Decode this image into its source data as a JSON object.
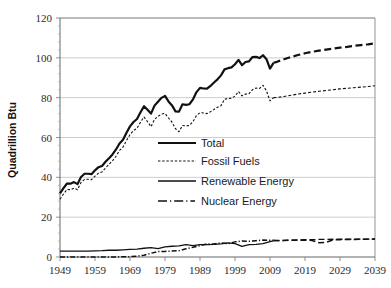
{
  "chart_data": {
    "type": "line",
    "title": "",
    "xlabel": "",
    "ylabel": "Quadrillion Btu",
    "xlim": [
      1949,
      2039
    ],
    "ylim": [
      0,
      120
    ],
    "grid": true,
    "legend_position": "center",
    "x_ticks": [
      1949,
      1959,
      1969,
      1979,
      1989,
      1999,
      2009,
      2019,
      2029,
      2039
    ],
    "y_ticks": [
      0,
      20,
      40,
      60,
      80,
      100,
      120
    ],
    "projection_start_year": 2010,
    "series": [
      {
        "name": "Total",
        "style": "solid-thick",
        "color": "#111111",
        "x": [
          1949,
          1950,
          1951,
          1952,
          1953,
          1954,
          1955,
          1956,
          1957,
          1958,
          1959,
          1960,
          1961,
          1962,
          1963,
          1964,
          1965,
          1966,
          1967,
          1968,
          1969,
          1970,
          1971,
          1972,
          1973,
          1974,
          1975,
          1976,
          1977,
          1978,
          1979,
          1980,
          1981,
          1982,
          1983,
          1984,
          1985,
          1986,
          1987,
          1988,
          1989,
          1990,
          1991,
          1992,
          1993,
          1994,
          1995,
          1996,
          1997,
          1998,
          1999,
          2000,
          2001,
          2002,
          2003,
          2004,
          2005,
          2006,
          2007,
          2008,
          2009,
          2010,
          2011,
          2013,
          2015,
          2017,
          2019,
          2021,
          2023,
          2025,
          2027,
          2029,
          2031,
          2033,
          2035,
          2037,
          2039
        ],
        "values": [
          32.0,
          34.6,
          36.9,
          36.8,
          37.6,
          36.6,
          40.2,
          41.8,
          41.8,
          41.6,
          43.5,
          45.1,
          45.7,
          47.8,
          49.6,
          51.5,
          54.0,
          57.0,
          58.9,
          62.4,
          65.6,
          67.8,
          69.3,
          72.7,
          75.7,
          73.9,
          72.0,
          76.0,
          78.0,
          79.9,
          80.9,
          78.1,
          76.1,
          73.1,
          73.0,
          76.7,
          76.4,
          76.7,
          79.2,
          82.8,
          84.9,
          84.6,
          84.5,
          85.9,
          87.6,
          89.2,
          91.2,
          94.2,
          94.8,
          95.2,
          96.8,
          99.0,
          96.3,
          97.9,
          98.2,
          100.4,
          100.5,
          99.9,
          101.3,
          99.3,
          94.6,
          97.5,
          98.0,
          99.3,
          100.4,
          101.4,
          102.3,
          103.0,
          103.6,
          104.1,
          104.6,
          105.1,
          105.5,
          106.0,
          106.4,
          106.8,
          107.3
        ]
      },
      {
        "name": "Fossil Fuels",
        "style": "dotted",
        "color": "#111111",
        "x": [
          1949,
          1950,
          1951,
          1952,
          1953,
          1954,
          1955,
          1956,
          1957,
          1958,
          1959,
          1960,
          1961,
          1962,
          1963,
          1964,
          1965,
          1966,
          1967,
          1968,
          1969,
          1970,
          1971,
          1972,
          1973,
          1974,
          1975,
          1976,
          1977,
          1978,
          1979,
          1980,
          1981,
          1982,
          1983,
          1984,
          1985,
          1986,
          1987,
          1988,
          1989,
          1990,
          1991,
          1992,
          1993,
          1994,
          1995,
          1996,
          1997,
          1998,
          1999,
          2000,
          2001,
          2002,
          2003,
          2004,
          2005,
          2006,
          2007,
          2008,
          2009,
          2010,
          2011,
          2013,
          2015,
          2017,
          2019,
          2021,
          2023,
          2025,
          2027,
          2029,
          2031,
          2033,
          2035,
          2037,
          2039
        ],
        "values": [
          29.0,
          31.6,
          33.9,
          33.8,
          34.6,
          33.8,
          37.4,
          39.0,
          39.0,
          38.8,
          40.6,
          42.1,
          42.7,
          44.7,
          46.5,
          48.3,
          50.6,
          53.5,
          55.2,
          58.5,
          61.4,
          63.5,
          64.6,
          67.7,
          70.3,
          68.0,
          65.4,
          69.1,
          70.6,
          71.8,
          72.1,
          69.8,
          67.7,
          64.4,
          62.9,
          66.0,
          65.8,
          66.1,
          68.0,
          71.0,
          72.5,
          72.3,
          72.0,
          72.9,
          74.1,
          75.2,
          76.0,
          79.2,
          79.6,
          79.7,
          80.8,
          83.1,
          80.9,
          81.8,
          82.0,
          84.0,
          84.8,
          84.6,
          86.2,
          83.4,
          78.4,
          80.0,
          80.1,
          80.6,
          81.2,
          81.8,
          82.3,
          82.8,
          83.2,
          83.6,
          84.0,
          84.4,
          84.7,
          85.0,
          85.3,
          85.6,
          86.0
        ]
      },
      {
        "name": "Renewable Energy",
        "style": "solid-thin",
        "color": "#111111",
        "x": [
          1949,
          1951,
          1953,
          1955,
          1957,
          1959,
          1961,
          1963,
          1965,
          1967,
          1969,
          1971,
          1973,
          1975,
          1977,
          1979,
          1981,
          1983,
          1985,
          1987,
          1989,
          1991,
          1993,
          1995,
          1997,
          1999,
          2001,
          2003,
          2005,
          2007,
          2009,
          2010,
          2011,
          2013,
          2015,
          2017,
          2019,
          2021,
          2023,
          2025,
          2027,
          2029,
          2031,
          2033,
          2035,
          2037,
          2039
        ],
        "values": [
          3.0,
          2.9,
          3.0,
          3.0,
          3.0,
          3.1,
          3.2,
          3.4,
          3.4,
          3.6,
          3.8,
          4.0,
          4.4,
          4.7,
          4.2,
          5.1,
          5.4,
          5.6,
          6.2,
          5.7,
          6.2,
          6.2,
          6.3,
          6.6,
          7.1,
          6.7,
          5.3,
          6.2,
          6.3,
          6.7,
          7.7,
          8.1,
          8.2,
          8.3,
          8.5,
          8.6,
          8.7,
          8.7,
          8.8,
          8.8,
          8.9,
          8.9,
          8.9,
          9.0,
          9.0,
          9.0,
          9.1
        ]
      },
      {
        "name": "Nuclear Energy",
        "style": "dash-dot",
        "color": "#111111",
        "x": [
          1949,
          1955,
          1959,
          1961,
          1963,
          1965,
          1967,
          1969,
          1971,
          1973,
          1975,
          1977,
          1979,
          1981,
          1983,
          1985,
          1987,
          1989,
          1991,
          1993,
          1995,
          1997,
          1999,
          2001,
          2003,
          2005,
          2007,
          2009,
          2010,
          2011,
          2013,
          2015,
          2017,
          2019,
          2021,
          2023,
          2025,
          2027,
          2029,
          2031,
          2033,
          2035,
          2037,
          2039
        ],
        "values": [
          0.0,
          0.0,
          0.0,
          0.02,
          0.04,
          0.04,
          0.09,
          0.15,
          0.4,
          0.9,
          1.9,
          2.7,
          2.8,
          3.0,
          3.2,
          4.1,
          4.9,
          5.7,
          6.6,
          6.5,
          7.1,
          6.7,
          7.6,
          8.0,
          7.9,
          8.2,
          8.5,
          8.4,
          8.4,
          8.3,
          8.3,
          8.4,
          8.4,
          8.5,
          8.3,
          7.2,
          7.3,
          8.6,
          8.7,
          8.8,
          8.8,
          8.9,
          8.9,
          9.0
        ]
      }
    ]
  },
  "axis": {
    "y_label": "Quadrillion Btu",
    "y_tick_labels": [
      "0",
      "20",
      "40",
      "60",
      "80",
      "100",
      "120"
    ],
    "x_tick_labels": [
      "1949",
      "1959",
      "1969",
      "1979",
      "1989",
      "1999",
      "2009",
      "2019",
      "2029",
      "2039"
    ]
  },
  "legend": {
    "items": [
      {
        "label": "Total",
        "style": "solid-thick"
      },
      {
        "label": "Fossil Fuels",
        "style": "dotted"
      },
      {
        "label": "Renewable Energy",
        "style": "solid-thin"
      },
      {
        "label": "Nuclear Energy",
        "style": "dash-dot"
      }
    ]
  }
}
